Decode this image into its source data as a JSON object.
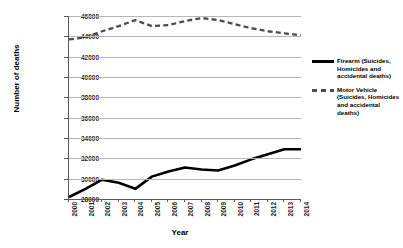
{
  "chart_data": {
    "type": "line",
    "title": "",
    "xlabel": "Year",
    "ylabel": "Number of deaths",
    "categories": [
      "2000",
      "2001",
      "2002",
      "2003",
      "2004",
      "2005",
      "2006",
      "2007",
      "2008",
      "2009",
      "2010",
      "2011",
      "2012",
      "2013",
      "2014"
    ],
    "x": [
      2000,
      2001,
      2002,
      2003,
      2004,
      2005,
      2006,
      2007,
      2008,
      2009,
      2010,
      2011,
      2012,
      2013,
      2014
    ],
    "ylim": [
      28000,
      46000
    ],
    "ytick_values": [
      28000,
      30000,
      32000,
      34000,
      36000,
      38000,
      40000,
      42000,
      44000,
      46000
    ],
    "ytick_labels": [
      "28000",
      "30000",
      "32000",
      "34000",
      "36000",
      "38000",
      "40000",
      "42000",
      "44000",
      "46000"
    ],
    "grid": "horizontal",
    "legend_position": "right",
    "series": [
      {
        "name": "Firearm (Suicides, Homicides and accidental deaths)",
        "style": "solid",
        "color": "#000000",
        "values": [
          28200,
          29000,
          29900,
          29600,
          29000,
          30200,
          30700,
          31100,
          30900,
          30800,
          31300,
          31900,
          32400,
          32900,
          32900
        ]
      },
      {
        "name": "Motor Vehicle (Suicides, Homicides and accidental deaths)",
        "style": "dashed",
        "color": "#4d4d4d",
        "values": [
          43700,
          43900,
          44500,
          45000,
          45600,
          45000,
          45100,
          45500,
          45800,
          45600,
          45200,
          44800,
          44500,
          44300,
          44100
        ]
      }
    ]
  },
  "axes": {
    "y_title": "Number of deaths",
    "x_title": "Year"
  },
  "legend": {
    "items": [
      {
        "label": "Firearm (Suicides, Homicides and accidental deaths)",
        "swatch": "solid-line-swatch"
      },
      {
        "label": "Motor Vehicle (Suicides, Homicides and accidental deaths)",
        "swatch": "dashed-line-swatch"
      }
    ]
  }
}
